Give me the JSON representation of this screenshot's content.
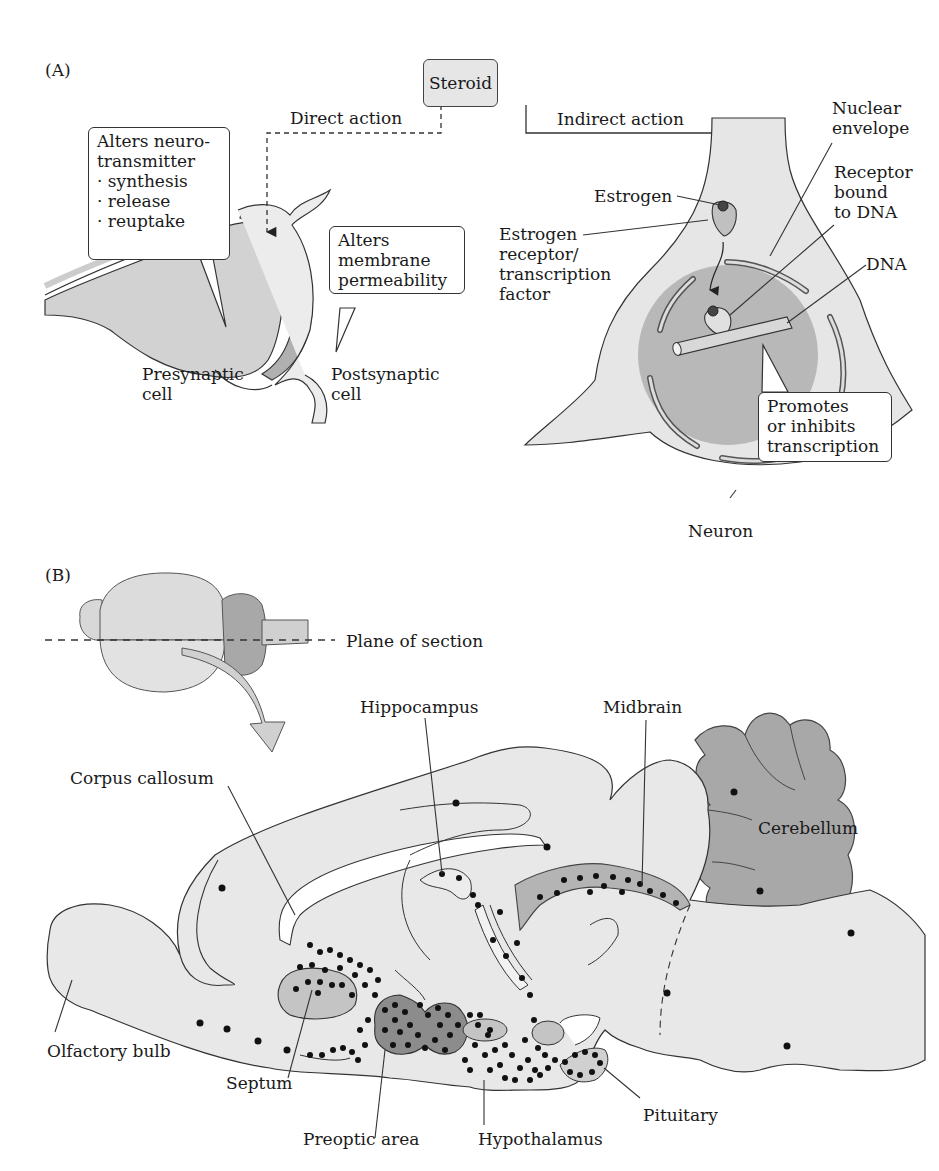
{
  "panel_a": {
    "label": "(A)",
    "steroid_box": "Steroid",
    "direct_action": "Direct action",
    "indirect_action": "Indirect action",
    "callout_neurotransmitter": {
      "title_line1": "Alters neuro-",
      "title_line2": "transmitter",
      "items": [
        "· synthesis",
        "· release",
        "· reuptake"
      ]
    },
    "callout_membrane": [
      "Alters",
      "membrane",
      "permeability"
    ],
    "presynaptic": [
      "Presynaptic",
      "cell"
    ],
    "postsynaptic": [
      "Postsynaptic",
      "cell"
    ],
    "estrogen": "Estrogen",
    "estrogen_receptor": [
      "Estrogen",
      "receptor/",
      "transcription",
      "factor"
    ],
    "nuclear_envelope": [
      "Nuclear",
      "envelope"
    ],
    "receptor_bound": [
      "Receptor",
      "bound",
      "to DNA"
    ],
    "dna": "DNA",
    "callout_transcription": [
      "Promotes",
      "or inhibits",
      "transcription"
    ],
    "neuron": "Neuron"
  },
  "panel_b": {
    "label": "(B)",
    "plane_of_section": "Plane of section",
    "labels": {
      "hippocampus": "Hippocampus",
      "midbrain": "Midbrain",
      "corpus_callosum": "Corpus callosum",
      "cerebellum": "Cerebellum",
      "olfactory_bulb": "Olfactory bulb",
      "septum": "Septum",
      "preoptic_area": "Preoptic area",
      "hypothalamus": "Hypothalamus",
      "pituitary": "Pituitary"
    }
  },
  "colors": {
    "light_tissue": "#e8e8e8",
    "mid_tissue": "#c8c8c8",
    "dark_tissue": "#a0a0a0",
    "nucleus": "#b4b4b4",
    "outline": "#333333",
    "dot": "#111111"
  }
}
